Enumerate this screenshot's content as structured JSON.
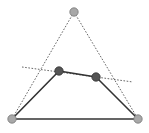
{
  "diagram": {
    "type": "geometric-construction",
    "colors": {
      "background": "#ffffff",
      "dotted_line": "#555555",
      "solid_line": "#333333",
      "outer_point_fill": "#a8a8a8",
      "outer_point_stroke": "#777777",
      "inner_point_fill": "#555555",
      "inner_point_stroke": "#333333"
    },
    "points": [
      {
        "id": "apex",
        "x": 74,
        "y": 12,
        "kind": "outer"
      },
      {
        "id": "bottom-left",
        "x": 12,
        "y": 119,
        "kind": "outer"
      },
      {
        "id": "bottom-right",
        "x": 138,
        "y": 119,
        "kind": "outer"
      },
      {
        "id": "mid-left",
        "x": 59,
        "y": 71,
        "kind": "inner"
      },
      {
        "id": "mid-right",
        "x": 96,
        "y": 77,
        "kind": "inner"
      }
    ],
    "dotted_segments": [
      {
        "from": "apex",
        "to": "bottom-left"
      },
      {
        "from": "apex",
        "to": "bottom-right"
      },
      {
        "x1": 22,
        "y1": 67,
        "x2": 133,
        "y2": 82
      }
    ],
    "solid_segments": [
      {
        "from": "bottom-left",
        "to": "bottom-right"
      },
      {
        "from": "bottom-left",
        "to": "mid-left"
      },
      {
        "from": "mid-left",
        "to": "mid-right"
      },
      {
        "from": "mid-right",
        "to": "bottom-right"
      }
    ]
  }
}
